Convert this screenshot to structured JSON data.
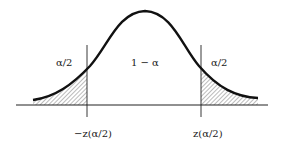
{
  "diagram": {
    "type": "normal-distribution-two-tailed",
    "labels": {
      "left_tail_area": "α/2",
      "center_area": "1 − α",
      "right_tail_area": "α/2",
      "left_critical": "−z(α/2)",
      "right_critical": "z(α/2)"
    },
    "colors": {
      "curve": "#111111",
      "axis": "#222222",
      "hatch": "#555555",
      "background": "#ffffff"
    }
  }
}
